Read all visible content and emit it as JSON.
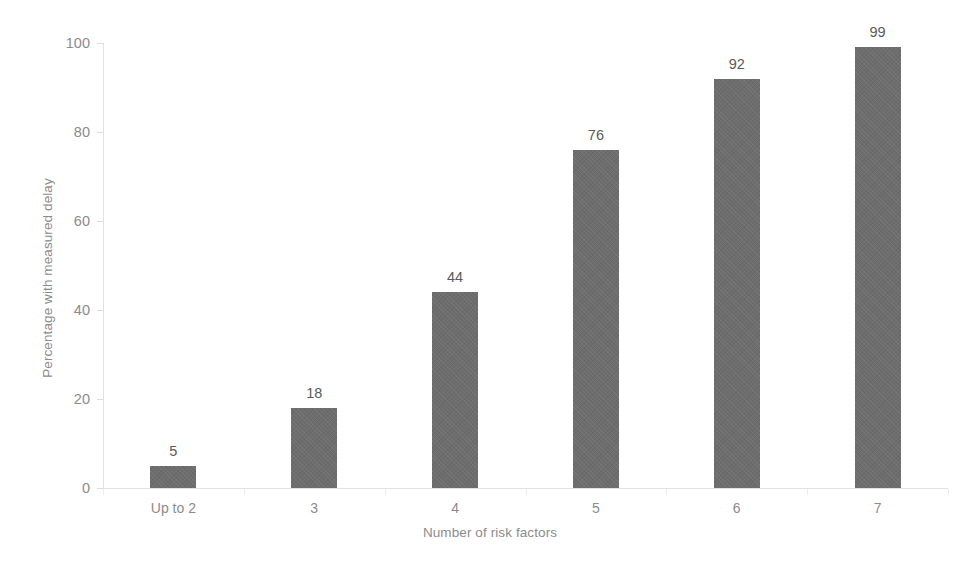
{
  "chart_data": {
    "type": "bar",
    "title": "",
    "xlabel": "Number of risk factors",
    "ylabel": "Percentage with measured delay",
    "categories": [
      "Up to 2",
      "3",
      "4",
      "5",
      "6",
      "7"
    ],
    "values": [
      5,
      18,
      44,
      76,
      92,
      99
    ],
    "value_labels": [
      "5",
      "18",
      "44",
      "76",
      "92",
      "99"
    ],
    "ylim": [
      0,
      100
    ],
    "xlim": null,
    "y_ticks": [
      0,
      20,
      40,
      60,
      80,
      100
    ],
    "y_tick_labels": [
      "0",
      "20",
      "40",
      "60",
      "80",
      "100"
    ],
    "grid": false,
    "legend": null,
    "legend_position": "none",
    "series": [
      {
        "name": "Percentage with measured delay",
        "values": [
          5,
          18,
          44,
          76,
          92,
          99
        ],
        "color": "#6d6d6d"
      }
    ],
    "annotations": [],
    "bar_color": "#6d6d6d",
    "axis_color": "#e2e2e2",
    "tick_label_color": "#8b8b8b",
    "data_label_color": "#5a5a5a",
    "background_color": "#ffffff"
  }
}
